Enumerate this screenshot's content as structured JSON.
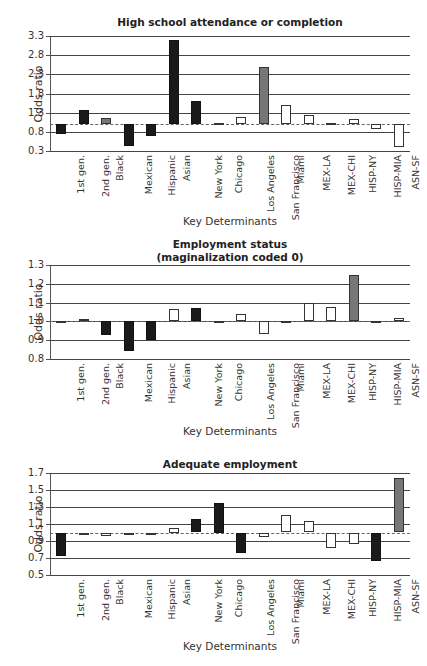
{
  "categories": [
    "1st gen.",
    "2nd gen.",
    "Black",
    "Mexican",
    "Hispanic",
    "Asian",
    "New York",
    "Chicago",
    "Los Angeles",
    "San Francisco",
    "Miami",
    "MEX-LA",
    "MEX-CHI",
    "HISP-NY",
    "HISP-MIA",
    "ASN-SF"
  ],
  "colors": {
    "black": "#1a1a1a",
    "gray": "#777777",
    "white": "#ffffff"
  },
  "chart_data": [
    {
      "type": "bar",
      "title": "High school attendance or completion",
      "xlabel": "Key Determinants",
      "ylabel": "Odds ratio",
      "ylim": [
        0.3,
        3.3
      ],
      "yticks": [
        "3.3",
        "2.8",
        "2.3",
        "1.8",
        "1.3",
        "0.8",
        "0.3"
      ],
      "baseline": 1.0,
      "grid": true,
      "categories": [
        "1st gen.",
        "2nd gen.",
        "Black",
        "Mexican",
        "Hispanic",
        "Asian",
        "New York",
        "Chicago",
        "Los Angeles",
        "San Francisco",
        "Miami",
        "MEX-LA",
        "MEX-CHI",
        "HISP-NY",
        "HISP-MIA",
        "ASN-SF"
      ],
      "values": [
        0.75,
        1.37,
        1.17,
        0.43,
        0.7,
        3.2,
        1.6,
        1.03,
        1.18,
        2.48,
        1.5,
        1.25,
        1.03,
        1.14,
        0.88,
        0.41
      ],
      "bar_colors": [
        "black",
        "black",
        "gray",
        "black",
        "black",
        "black",
        "black",
        "white",
        "white",
        "gray",
        "white",
        "white",
        "white",
        "white",
        "white",
        "white"
      ]
    },
    {
      "type": "bar",
      "title": "Employment status",
      "subtitle": "(maginalization coded 0)",
      "xlabel": "Key Determinants",
      "ylabel": "Odds ratio",
      "ylim": [
        0.8,
        1.3
      ],
      "yticks": [
        "1.3",
        "1.2",
        "1.1",
        "1.0",
        "0.9",
        "0.8"
      ],
      "baseline": 1.0,
      "grid": true,
      "categories": [
        "1st gen.",
        "2nd gen.",
        "Black",
        "Mexican",
        "Hispanic",
        "Asian",
        "New York",
        "Chicago",
        "Los Angeles",
        "San Francisco",
        "Miami",
        "MEX-LA",
        "MEX-CHI",
        "HISP-NY",
        "HISP-MIA",
        "ASN-SF"
      ],
      "values": [
        0.99,
        1.015,
        0.93,
        0.845,
        0.9,
        1.065,
        1.07,
        0.99,
        1.04,
        0.935,
        0.99,
        1.1,
        1.075,
        1.245,
        0.99,
        1.02
      ],
      "bar_colors": [
        "white",
        "white",
        "black",
        "black",
        "black",
        "white",
        "black",
        "white",
        "white",
        "white",
        "white",
        "white",
        "white",
        "gray",
        "white",
        "white"
      ]
    },
    {
      "type": "bar",
      "title": "Adequate employment",
      "xlabel": "Key Determinants",
      "ylabel": "Odds ratio",
      "ylim": [
        0.5,
        1.7
      ],
      "yticks": [
        "1.7",
        "1.5",
        "1.3",
        "1.1",
        "0.9",
        "0.7",
        "0.5"
      ],
      "baseline": 1.0,
      "grid": true,
      "categories": [
        "1st gen.",
        "2nd gen.",
        "Black",
        "Mexican",
        "Hispanic",
        "Asian",
        "New York",
        "Chicago",
        "Los Angeles",
        "San Francisco",
        "Miami",
        "MEX-LA",
        "MEX-CHI",
        "HISP-NY",
        "HISP-MIA",
        "ASN-SF"
      ],
      "values": [
        0.72,
        0.98,
        0.96,
        0.98,
        0.97,
        1.05,
        1.16,
        1.35,
        0.76,
        0.95,
        1.21,
        1.14,
        0.82,
        0.86,
        0.66,
        1.64
      ],
      "bar_colors": [
        "black",
        "white",
        "white",
        "white",
        "white",
        "white",
        "black",
        "black",
        "black",
        "white",
        "white",
        "white",
        "white",
        "white",
        "black",
        "gray"
      ]
    }
  ],
  "layout": [
    {
      "top": 0,
      "titleTop": 16,
      "plotTop": 36,
      "plotHeight": 115,
      "xlabelsTop": 153,
      "xtitleTop": 215
    },
    {
      "top": 0,
      "titleTop": 238,
      "plotTop": 265,
      "plotHeight": 94,
      "xlabelsTop": 361,
      "xtitleTop": 425
    },
    {
      "top": 0,
      "titleTop": 458,
      "plotTop": 473,
      "plotHeight": 102,
      "xlabelsTop": 577,
      "xtitleTop": 640
    }
  ]
}
